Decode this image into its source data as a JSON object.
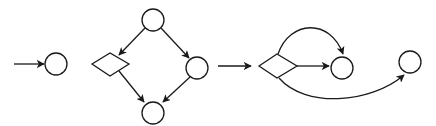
{
  "diagram": {
    "type": "flow-graph-patterns",
    "stroke_color": "#1a1a1a",
    "background": "#ffffff",
    "panels": [
      {
        "id": "panel-1",
        "description": "entry arrow into a single state",
        "nodes": [
          {
            "id": "p1-state",
            "shape": "circle",
            "cx": 56,
            "cy": 64,
            "r": 11
          }
        ],
        "edges": [
          {
            "id": "p1-entry",
            "path": "M14,64 L44,64",
            "arrow": true
          }
        ]
      },
      {
        "id": "panel-2",
        "description": "diamond-shaped graph: top state branches to decision and state, both converge on bottom state",
        "nodes": [
          {
            "id": "p2-top",
            "shape": "circle",
            "cx": 153,
            "cy": 20,
            "r": 11
          },
          {
            "id": "p2-decision",
            "shape": "diamond",
            "points": "92,64 110,53 129,64 110,76"
          },
          {
            "id": "p2-right",
            "shape": "circle",
            "cx": 197,
            "cy": 68,
            "r": 11
          },
          {
            "id": "p2-bottom",
            "shape": "circle",
            "cx": 153,
            "cy": 113,
            "r": 11
          }
        ],
        "edges": [
          {
            "id": "p2-top-to-decision",
            "path": "M145,28 L119,55",
            "arrow": true
          },
          {
            "id": "p2-top-to-right",
            "path": "M161,28 L189,58",
            "arrow": true
          },
          {
            "id": "p2-decision-to-bottom",
            "path": "M119,71 L144,102",
            "arrow": true
          },
          {
            "id": "p2-right-to-bottom",
            "path": "M190,77 L163,102",
            "arrow": true
          }
        ]
      },
      {
        "id": "panel-3",
        "description": "decision node with three outgoing branches to two states",
        "nodes": [
          {
            "id": "p3-decision",
            "shape": "diamond",
            "points": "259,66 277,54 297,66 277,78"
          },
          {
            "id": "p3-state-a",
            "shape": "circle",
            "cx": 342,
            "cy": 68,
            "r": 11
          },
          {
            "id": "p3-state-b",
            "shape": "circle",
            "cx": 410,
            "cy": 62,
            "r": 11
          }
        ],
        "edges": [
          {
            "id": "p3-entry",
            "path": "M218,66 L251,66",
            "arrow": true
          },
          {
            "id": "p3-arc-top",
            "path": "M278,54 C290,20 330,18 343,54",
            "arrow": true
          },
          {
            "id": "p3-straight",
            "path": "M297,66 L329,66",
            "arrow": true
          },
          {
            "id": "p3-arc-bottom",
            "path": "M279,78 C305,108 370,104 404,75",
            "arrow": true
          }
        ]
      }
    ]
  }
}
